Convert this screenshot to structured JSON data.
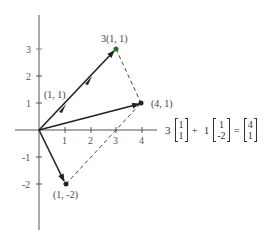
{
  "diagram": {
    "axes": {
      "x_ticks": [
        "1",
        "2",
        "3",
        "4"
      ],
      "y_ticks": [
        "3",
        "2",
        "1",
        "-1",
        "-2"
      ]
    },
    "points": {
      "unit": "(1, 1)",
      "scaled": "3(1, 1)",
      "sum": "(4, 1)",
      "second": "(1, -2)"
    },
    "equation": {
      "coef1": "3",
      "vec1": [
        "1",
        "1"
      ],
      "plus": "+",
      "coef2": "1",
      "vec2": [
        "1",
        "-2"
      ],
      "equals": "=",
      "result": [
        "4",
        "1"
      ]
    },
    "colors": {
      "ink": "#222222",
      "accent_point": "#2e6b2e"
    }
  }
}
